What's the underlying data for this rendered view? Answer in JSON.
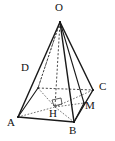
{
  "figure": {
    "type": "geometry-diagram",
    "stroke_color": "#1a1a1a",
    "background_color": "#ffffff",
    "dashed_color": "#2a2a2a"
  },
  "labels": {
    "apex": "O",
    "base_front_left": "A",
    "base_front_right": "B",
    "base_right": "C",
    "base_back_left": "D",
    "foot_of_altitude": "H",
    "point_on_bc": "M"
  },
  "points": {
    "O": {
      "name": "O",
      "x": 60,
      "y": 22
    },
    "A": {
      "name": "A",
      "x": 18,
      "y": 117
    },
    "B": {
      "name": "B",
      "x": 74,
      "y": 122
    },
    "C": {
      "name": "C",
      "x": 93,
      "y": 90
    },
    "D": {
      "name": "D",
      "x": 38,
      "y": 88
    },
    "H": {
      "name": "H",
      "x": 55,
      "y": 107
    },
    "M": {
      "name": "M",
      "x": 84,
      "y": 103
    }
  },
  "label_positions": {
    "O": {
      "x": 55,
      "y": 3
    },
    "A": {
      "x": 8,
      "y": 118
    },
    "B": {
      "x": 69,
      "y": 126
    },
    "C": {
      "x": 99,
      "y": 82
    },
    "D": {
      "x": 21,
      "y": 63
    },
    "H": {
      "x": 50,
      "y": 110
    },
    "M": {
      "x": 85,
      "y": 101
    }
  },
  "edges": [
    {
      "name": "edge-OA",
      "from": "O",
      "to": "A",
      "style": "solid"
    },
    {
      "name": "edge-OB",
      "from": "O",
      "to": "B",
      "style": "solid"
    },
    {
      "name": "edge-OC",
      "from": "O",
      "to": "C",
      "style": "solid"
    },
    {
      "name": "edge-OD",
      "from": "O",
      "to": "D",
      "style": "dashed"
    },
    {
      "name": "edge-OH",
      "from": "O",
      "to": "H",
      "style": "dashed"
    },
    {
      "name": "edge-OM",
      "from": "O",
      "to": "M",
      "style": "solid"
    },
    {
      "name": "edge-AB",
      "from": "A",
      "to": "B",
      "style": "solid"
    },
    {
      "name": "edge-BC",
      "from": "B",
      "to": "C",
      "style": "solid"
    },
    {
      "name": "edge-CD",
      "from": "C",
      "to": "D",
      "style": "dashed"
    },
    {
      "name": "edge-DA",
      "from": "D",
      "to": "A",
      "style": "solid"
    },
    {
      "name": "edge-AH",
      "from": "A",
      "to": "H",
      "style": "dashed"
    },
    {
      "name": "edge-HB",
      "from": "H",
      "to": "B",
      "style": "dashed"
    },
    {
      "name": "edge-HM",
      "from": "H",
      "to": "M",
      "style": "dashed"
    },
    {
      "name": "edge-HD",
      "from": "H",
      "to": "D",
      "style": "dashed"
    },
    {
      "name": "edge-HC",
      "from": "H",
      "to": "C",
      "style": "dashed"
    },
    {
      "name": "edge-BM",
      "from": "B",
      "to": "M",
      "style": "solid"
    }
  ],
  "markers": {
    "right_angle_at_H": {
      "name": "right-angle-marker",
      "vertex": "H",
      "description": "small square indicating OH is perpendicular to the base plane"
    }
  }
}
